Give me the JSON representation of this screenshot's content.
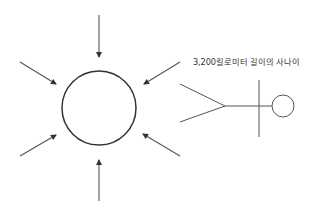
{
  "diagram": {
    "label": "3,200킬로미터 길이의 사나이",
    "colors": {
      "background": "#ffffff",
      "circle_stroke": "#333333",
      "arrow_stroke": "#555555",
      "figure_stroke": "#555555",
      "text": "#333333"
    },
    "central_circle": {
      "cx": 99,
      "cy": 108,
      "r": 37
    },
    "arrows": [
      {
        "name": "top",
        "from": [
          99,
          15
        ],
        "to": [
          99,
          57
        ]
      },
      {
        "name": "bottom",
        "from": [
          99,
          201
        ],
        "to": [
          99,
          160
        ]
      },
      {
        "name": "upper-left",
        "from": [
          20,
          62
        ],
        "to": [
          56,
          84
        ]
      },
      {
        "name": "lower-left",
        "from": [
          20,
          156
        ],
        "to": [
          56,
          135
        ]
      },
      {
        "name": "upper-right",
        "from": [
          180,
          62
        ],
        "to": [
          144,
          84
        ]
      },
      {
        "name": "lower-right",
        "from": [
          180,
          156
        ],
        "to": [
          143,
          134
        ]
      }
    ],
    "stick_figure": {
      "legs": [
        [
          [
            180,
            84
          ],
          [
            225,
            106
          ]
        ],
        [
          [
            180,
            122
          ],
          [
            225,
            106
          ]
        ]
      ],
      "body": [
        [
          225,
          106
        ],
        [
          272,
          106
        ]
      ],
      "arms": [
        [
          259,
          80
        ],
        [
          259,
          137
        ]
      ],
      "head": {
        "cx": 283,
        "cy": 106,
        "r": 11
      }
    }
  }
}
